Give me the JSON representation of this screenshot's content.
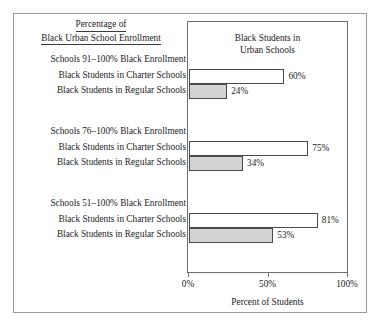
{
  "figure": {
    "outer_title_line1": "Percentage of",
    "outer_title_line2": "Black Urban School Enrollment",
    "plot_title_line1": "Black Students in",
    "plot_title_line2": "Urban Schools",
    "axis_title": "Percent of Students"
  },
  "chart_data": {
    "type": "bar",
    "orientation": "horizontal",
    "title": "Black Students in Urban Schools",
    "supertitle": "Percentage of Black Urban School Enrollment",
    "xlabel": "Percent of Students",
    "ylabel": "",
    "xlim": [
      0,
      100
    ],
    "xticks": [
      0,
      50,
      100
    ],
    "xtick_labels": [
      "0%",
      "50%",
      "100%"
    ],
    "grid": false,
    "legend": "none",
    "value_suffix": "%",
    "groups": [
      {
        "group_label": "Schools 91–100% Black Enrollment",
        "bars": [
          {
            "label": "Black Students in Charter Schools",
            "value": 60,
            "value_label": "60%",
            "style": "charter"
          },
          {
            "label": "Black Students in Regular Schools",
            "value": 24,
            "value_label": "24%",
            "style": "regular"
          }
        ]
      },
      {
        "group_label": "Schools 76–100% Black Enrollment",
        "bars": [
          {
            "label": "Black Students in Charter Schools",
            "value": 75,
            "value_label": "75%",
            "style": "charter"
          },
          {
            "label": "Black Students in Regular Schools",
            "value": 34,
            "value_label": "34%",
            "style": "regular"
          }
        ]
      },
      {
        "group_label": "Schools 51–100% Black Enrollment",
        "bars": [
          {
            "label": "Black Students in Charter Schools",
            "value": 81,
            "value_label": "81%",
            "style": "charter"
          },
          {
            "label": "Black Students in Regular Schools",
            "value": 53,
            "value_label": "53%",
            "style": "regular"
          }
        ]
      }
    ],
    "colors": {
      "charter_fill": "#ffffff",
      "regular_fill": "#d2d2d2",
      "bar_outline": "#4a4a4a",
      "frame": "#6e6e6e",
      "outer_frame": "#9a9a9a",
      "text": "#1b1b1b"
    }
  }
}
